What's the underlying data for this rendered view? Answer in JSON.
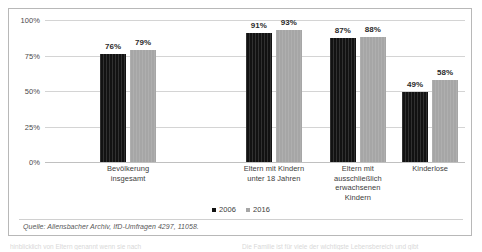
{
  "chart_data": {
    "type": "bar",
    "title": "",
    "subtitle": "",
    "xlabel": "",
    "ylabel": "",
    "ylim": [
      0,
      100
    ],
    "grid": true,
    "legend_position": "bottom",
    "categories": [
      "Bevölkerung\ninsgesamt",
      "Eltern mit Kindern\nunter 18 Jahren",
      "Eltern mit\nausschließlich\nerwachsenen\nKindern",
      "Kinderlose"
    ],
    "ytick_labels": [
      "100%",
      "75%",
      "50%",
      "25%",
      "0%"
    ],
    "ytick_values": [
      100,
      75,
      50,
      25,
      0
    ],
    "series": [
      {
        "name": "2006",
        "color": "#121212",
        "values": [
          76,
          91,
          87,
          49
        ],
        "value_labels": [
          "76%",
          "91%",
          "87%",
          "49%"
        ]
      },
      {
        "name": "2016",
        "color": "#a6a6a6",
        "values": [
          79,
          93,
          88,
          58
        ],
        "value_labels": [
          "79%",
          "93%",
          "88%",
          "58%"
        ]
      }
    ]
  },
  "legend": {
    "items": [
      {
        "label": "2006",
        "color": "#121212"
      },
      {
        "label": "2016",
        "color": "#a6a6a6"
      }
    ]
  },
  "source": {
    "text": "Quelle: Allensbacher Archiv, IfD-Umfragen 4297, 11058."
  },
  "footer": {
    "left_text": "hinblicklich von Eltern  genannt  wenn  sie  nach",
    "right_text": "Die Familie ist  für viele  der wichtigste  Lebensbereich  und  gibt"
  },
  "colors": {
    "series_2006": "#121212",
    "series_2016": "#a6a6a6",
    "grid": "#d4d4d4",
    "frame": "#b8b8b8",
    "text": "#3d3d3d"
  }
}
